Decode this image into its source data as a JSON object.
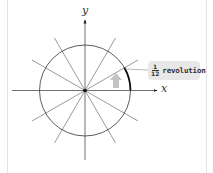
{
  "diagram": {
    "type": "unit-circle-divisions",
    "axes": {
      "x_label": "x",
      "y_label": "y"
    },
    "circle": {
      "center": [
        85,
        90.5
      ],
      "radius": 45.5,
      "divisions": 12
    },
    "callout": {
      "numerator": "1",
      "denominator": "12",
      "text": "revolution"
    },
    "highlighted_arc": {
      "from_deg": 0,
      "to_deg": 30
    },
    "colors": {
      "line": "#333333",
      "callout_bg": "#e8e8e8",
      "arrow": "#b0b0b0"
    }
  }
}
